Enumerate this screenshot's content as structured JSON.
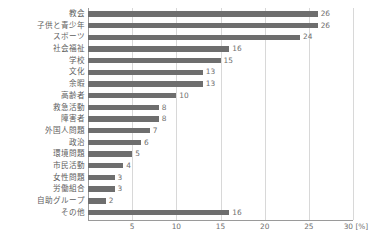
{
  "chart_data": {
    "type": "bar",
    "orientation": "horizontal",
    "title": "",
    "xlabel": "[%]",
    "ylabel": "",
    "xlim": [
      0,
      30
    ],
    "xticks": [
      0,
      5,
      10,
      15,
      20,
      25,
      30
    ],
    "xtick_labels": [
      "",
      "5",
      "10",
      "15",
      "20",
      "25",
      "30"
    ],
    "unit_label": "[%]",
    "grid": true,
    "grid_axis": "x",
    "legend": false,
    "bar_color": "#6e6e6e",
    "grid_color": "#d8d8d8",
    "axis_color": "#9a9a9a",
    "text_color": "#6f6f6f",
    "categories": [
      "教会",
      "子供と青少年",
      "スポーツ",
      "社会福祉",
      "学校",
      "文化",
      "余暇",
      "高齢者",
      "救急活動",
      "障害者",
      "外国人問題",
      "政治",
      "環境問題",
      "市民活動",
      "女性問題",
      "労働組合",
      "自助グループ",
      "その他"
    ],
    "values": [
      26,
      26,
      24,
      16,
      15,
      13,
      13,
      10,
      8,
      8,
      7,
      6,
      5,
      4,
      3,
      3,
      2,
      16
    ],
    "value_labels": [
      "26",
      "26",
      "24",
      "16",
      "15",
      "13",
      "13",
      "10",
      "8",
      "8",
      "7",
      "6",
      "5",
      "4",
      "3",
      "3",
      "2",
      "16"
    ]
  }
}
